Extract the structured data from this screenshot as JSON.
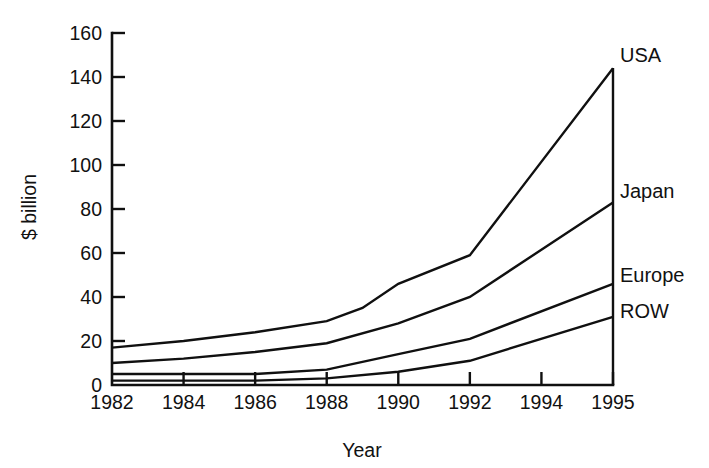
{
  "chart_data": {
    "type": "area",
    "title": "",
    "xlabel": "Year",
    "ylabel": "$ billion",
    "categories": [
      "1982",
      "1984",
      "1986",
      "1988",
      "1990",
      "1992",
      "1994",
      "1995"
    ],
    "x_tick_labels": [
      "1982",
      "1984",
      "1986",
      "1988",
      "1990",
      "1992",
      "1994",
      "1995"
    ],
    "y_tick_labels": [
      "0",
      "20",
      "40",
      "60",
      "80",
      "100",
      "120",
      "140",
      "160"
    ],
    "y_tick_values": [
      0,
      20,
      40,
      60,
      80,
      100,
      120,
      140,
      160
    ],
    "ylim": [
      0,
      160
    ],
    "xlim": [
      1982,
      1995
    ],
    "grid": false,
    "legend_position": "right-inline",
    "stacked": true,
    "note": "Cumulative stacked bands; plotted lines are running totals. ROW bottom, then Europe, Japan, USA on top.",
    "series": [
      {
        "name": "ROW",
        "label": "ROW",
        "order": 1,
        "x": [
          1982,
          1984,
          1986,
          1988,
          1990,
          1992,
          1995
        ],
        "values": [
          2,
          2,
          2,
          3,
          6,
          11,
          31
        ],
        "cumulative": [
          2,
          2,
          2,
          3,
          6,
          11,
          31
        ]
      },
      {
        "name": "Europe",
        "label": "Europe",
        "order": 2,
        "x": [
          1982,
          1984,
          1986,
          1988,
          1990,
          1992,
          1995
        ],
        "values": [
          3,
          3,
          3,
          4,
          8,
          10,
          15
        ],
        "cumulative": [
          5,
          5,
          5,
          7,
          14,
          21,
          46
        ]
      },
      {
        "name": "Japan",
        "label": "Japan",
        "order": 3,
        "x": [
          1982,
          1984,
          1986,
          1988,
          1990,
          1992,
          1995
        ],
        "values": [
          5,
          7,
          10,
          12,
          14,
          19,
          37
        ],
        "cumulative": [
          10,
          12,
          15,
          19,
          28,
          40,
          83
        ]
      },
      {
        "name": "USA",
        "label": "USA",
        "order": 4,
        "x": [
          1982,
          1984,
          1986,
          1988,
          1989,
          1990,
          1992,
          1995
        ],
        "values": [
          7,
          8,
          9,
          10,
          16,
          18,
          19,
          61
        ],
        "cumulative": [
          17,
          20,
          24,
          29,
          35,
          46,
          59,
          144
        ]
      }
    ]
  },
  "series_labels": {
    "usa": "USA",
    "japan": "Japan",
    "europe": "Europe",
    "row": "ROW"
  },
  "axes": {
    "y_title": "$ billion",
    "x_title": "Year"
  }
}
